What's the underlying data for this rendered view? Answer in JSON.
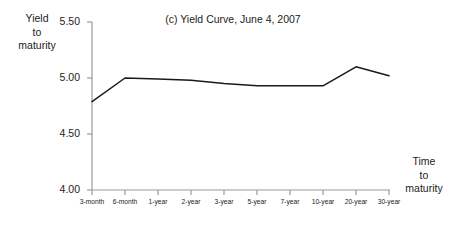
{
  "chart_data": {
    "type": "line",
    "title": "(c) Yield Curve, June 4, 2007",
    "xlabel": "Time to maturity",
    "ylabel": "Yield to maturity",
    "categories": [
      "3-month",
      "6-month",
      "1-year",
      "2-year",
      "3-year",
      "5-year",
      "7-year",
      "10-year",
      "20-year",
      "30-year"
    ],
    "values": [
      4.79,
      5.0,
      4.99,
      4.98,
      4.95,
      4.93,
      4.93,
      4.93,
      5.1,
      5.02
    ],
    "series": [
      {
        "name": "Yield curve",
        "values": [
          4.79,
          5.0,
          4.99,
          4.98,
          4.95,
          4.93,
          4.93,
          4.93,
          5.1,
          5.02
        ]
      }
    ],
    "ylim": [
      4.0,
      5.5
    ],
    "ytick_labels": [
      "4.00",
      "4.50",
      "5.00",
      "5.50"
    ],
    "ytick_values": [
      4.0,
      4.5,
      5.0,
      5.5
    ],
    "grid": false,
    "legend": false,
    "line_color": "#1a1a1a",
    "axis_color": "#9a9a9a"
  },
  "labels": {
    "ylabel_line1": "Yield",
    "ylabel_line2": "to",
    "ylabel_line3": "maturity",
    "xlabel_line1": "Time",
    "xlabel_line2": "to",
    "xlabel_line3": "maturity"
  }
}
